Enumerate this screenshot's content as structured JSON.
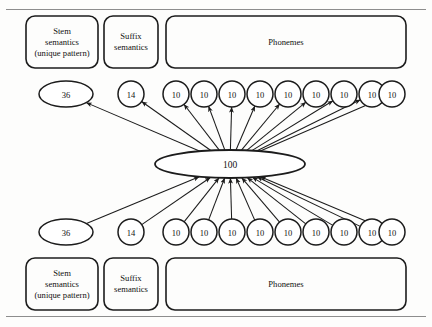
{
  "figure": {
    "stroke_color": "#1c1c1c",
    "rule_color": "#8d8d8d",
    "background": "#fdfdfc"
  },
  "rules": {
    "top_label": "top-page-rule",
    "bottom_label": "bottom-page-rule"
  },
  "layers": {
    "output": {
      "name": "output-layer",
      "boxes": [
        {
          "id": "stem-semantics-output",
          "label": "Stem\nsemantics\n(unique pattern)"
        },
        {
          "id": "suffix-semantics-output",
          "label": "Suffix\nsemantics"
        },
        {
          "id": "phonemes-output",
          "label": "Phonemes"
        }
      ],
      "units": [
        {
          "id": "stem-units-output",
          "value": "36",
          "shape": "ellipse"
        },
        {
          "id": "suffix-units-output",
          "value": "14",
          "shape": "circle"
        },
        {
          "id": "phoneme-unit-output-1",
          "value": "10",
          "shape": "circle"
        },
        {
          "id": "phoneme-unit-output-2",
          "value": "10",
          "shape": "circle"
        },
        {
          "id": "phoneme-unit-output-3",
          "value": "10",
          "shape": "circle"
        },
        {
          "id": "phoneme-unit-output-4",
          "value": "10",
          "shape": "circle"
        },
        {
          "id": "phoneme-unit-output-5",
          "value": "10",
          "shape": "circle"
        },
        {
          "id": "phoneme-unit-output-6",
          "value": "10",
          "shape": "circle"
        },
        {
          "id": "phoneme-unit-output-7",
          "value": "10",
          "shape": "circle"
        },
        {
          "id": "phoneme-unit-output-8",
          "value": "10",
          "shape": "circle"
        },
        {
          "id": "phoneme-unit-output-9",
          "value": "10",
          "shape": "circle"
        }
      ]
    },
    "hidden": {
      "name": "hidden-layer",
      "unit": {
        "id": "hidden-units",
        "value": "100",
        "shape": "ellipse"
      }
    },
    "input": {
      "name": "input-layer",
      "boxes": [
        {
          "id": "stem-semantics-input",
          "label": "Stem\nsemantics\n(unique pattern)"
        },
        {
          "id": "suffix-semantics-input",
          "label": "Suffix\nsemantics"
        },
        {
          "id": "phonemes-input",
          "label": "Phonemes"
        }
      ],
      "units": [
        {
          "id": "stem-units-input",
          "value": "36",
          "shape": "ellipse"
        },
        {
          "id": "suffix-units-input",
          "value": "14",
          "shape": "circle"
        },
        {
          "id": "phoneme-unit-input-1",
          "value": "10",
          "shape": "circle"
        },
        {
          "id": "phoneme-unit-input-2",
          "value": "10",
          "shape": "circle"
        },
        {
          "id": "phoneme-unit-input-3",
          "value": "10",
          "shape": "circle"
        },
        {
          "id": "phoneme-unit-input-4",
          "value": "10",
          "shape": "circle"
        },
        {
          "id": "phoneme-unit-input-5",
          "value": "10",
          "shape": "circle"
        },
        {
          "id": "phoneme-unit-input-6",
          "value": "10",
          "shape": "circle"
        },
        {
          "id": "phoneme-unit-input-7",
          "value": "10",
          "shape": "circle"
        },
        {
          "id": "phoneme-unit-input-8",
          "value": "10",
          "shape": "circle"
        },
        {
          "id": "phoneme-unit-input-9",
          "value": "10",
          "shape": "circle"
        }
      ]
    }
  },
  "connections": {
    "upward_label": "hidden-to-output-connections",
    "inward_label": "input-to-hidden-connections"
  },
  "geometry": {
    "hub": {
      "cx": 230,
      "cy": 164,
      "rx": 75,
      "ry": 14
    },
    "output_boxes": [
      {
        "x": 26,
        "y": 16,
        "w": 72,
        "h": 52,
        "r": 9
      },
      {
        "x": 104,
        "y": 16,
        "w": 54,
        "h": 52,
        "r": 9
      },
      {
        "x": 166,
        "y": 16,
        "w": 240,
        "h": 52,
        "r": 9
      }
    ],
    "input_boxes": [
      {
        "x": 26,
        "y": 258,
        "w": 72,
        "h": 52,
        "r": 9
      },
      {
        "x": 104,
        "y": 258,
        "w": 54,
        "h": 52,
        "r": 9
      },
      {
        "x": 166,
        "y": 258,
        "w": 240,
        "h": 52,
        "r": 9
      }
    ],
    "output_units": [
      {
        "cx": 66,
        "cy": 94,
        "rx": 27,
        "ry": 13
      },
      {
        "cx": 131,
        "cy": 94,
        "rx": 13,
        "ry": 13
      },
      {
        "cx": 176,
        "cy": 94,
        "rx": 13,
        "ry": 13
      },
      {
        "cx": 204,
        "cy": 94,
        "rx": 13,
        "ry": 13
      },
      {
        "cx": 232,
        "cy": 94,
        "rx": 13,
        "ry": 13
      },
      {
        "cx": 260,
        "cy": 94,
        "rx": 13,
        "ry": 13
      },
      {
        "cx": 288,
        "cy": 94,
        "rx": 13,
        "ry": 13
      },
      {
        "cx": 316,
        "cy": 94,
        "rx": 13,
        "ry": 13
      },
      {
        "cx": 344,
        "cy": 94,
        "rx": 13,
        "ry": 13
      },
      {
        "cx": 372,
        "cy": 94,
        "rx": 13,
        "ry": 13
      },
      {
        "cx": 392,
        "cy": 94,
        "rx": 13,
        "ry": 13
      }
    ],
    "input_units": [
      {
        "cx": 66,
        "cy": 232,
        "rx": 27,
        "ry": 13
      },
      {
        "cx": 131,
        "cy": 232,
        "rx": 13,
        "ry": 13
      },
      {
        "cx": 176,
        "cy": 232,
        "rx": 13,
        "ry": 13
      },
      {
        "cx": 204,
        "cy": 232,
        "rx": 13,
        "ry": 13
      },
      {
        "cx": 232,
        "cy": 232,
        "rx": 13,
        "ry": 13
      },
      {
        "cx": 260,
        "cy": 232,
        "rx": 13,
        "ry": 13
      },
      {
        "cx": 288,
        "cy": 232,
        "rx": 13,
        "ry": 13
      },
      {
        "cx": 316,
        "cy": 232,
        "rx": 13,
        "ry": 13
      },
      {
        "cx": 344,
        "cy": 232,
        "rx": 13,
        "ry": 13
      },
      {
        "cx": 372,
        "cy": 232,
        "rx": 13,
        "ry": 13
      },
      {
        "cx": 392,
        "cy": 232,
        "rx": 13,
        "ry": 13
      }
    ]
  }
}
